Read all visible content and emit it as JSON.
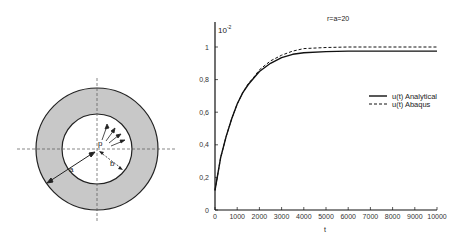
{
  "diagram": {
    "center": [
      97,
      149
    ],
    "outer_radius": 61,
    "inner_radius": 35,
    "fill_color": "#c8c8c8",
    "labels": {
      "pressure": "p",
      "inner_radius": "b",
      "outer_radius": "a"
    }
  },
  "chart_data": {
    "type": "line",
    "title": "",
    "annotation": "r=a=20",
    "scale_label": "10",
    "scale_exponent": "-2",
    "xlabel": "t",
    "ylabel": "",
    "xlim": [
      0,
      10000
    ],
    "ylim": [
      0,
      1.1
    ],
    "x_ticks": [
      0,
      1000,
      2000,
      3000,
      4000,
      5000,
      6000,
      7000,
      8000,
      9000,
      10000
    ],
    "x_tick_labels": [
      "0",
      "1000",
      "2000",
      "3000",
      "4000",
      "5000",
      "6000",
      "7000",
      "8000",
      "9000",
      "10000"
    ],
    "y_ticks": [
      0,
      0.2,
      0.4,
      0.6,
      0.8,
      1
    ],
    "y_tick_labels": [
      "0",
      "0,2",
      "0,4",
      "0,6",
      "0,8",
      "1"
    ],
    "grid": false,
    "legend_position": "right-center",
    "x": [
      0,
      250,
      500,
      750,
      1000,
      1250,
      1500,
      1750,
      2000,
      2500,
      3000,
      3500,
      4000,
      5000,
      6000,
      7000,
      8000,
      9000,
      10000
    ],
    "series": [
      {
        "name": "u(t) Analytical",
        "style": "solid",
        "values": [
          0.12,
          0.32,
          0.45,
          0.56,
          0.65,
          0.72,
          0.77,
          0.81,
          0.85,
          0.9,
          0.935,
          0.955,
          0.965,
          0.972,
          0.975,
          0.975,
          0.975,
          0.975,
          0.975
        ]
      },
      {
        "name": "u(t) Abaqus",
        "style": "dashed",
        "values": [
          0.12,
          0.32,
          0.45,
          0.56,
          0.65,
          0.72,
          0.775,
          0.815,
          0.86,
          0.915,
          0.95,
          0.975,
          0.99,
          0.997,
          1.0,
          1.0,
          1.0,
          1.0,
          1.0
        ]
      }
    ]
  },
  "plot_box": {
    "x0": 215,
    "x1": 437,
    "y0": 210,
    "y1": 47
  }
}
